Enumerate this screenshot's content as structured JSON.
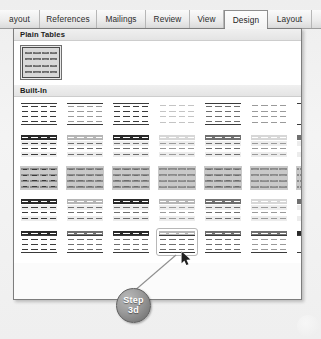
{
  "window": {
    "app_context": "word-table-styles-gallery"
  },
  "ribbon": {
    "tabs": [
      {
        "label": "ayout",
        "active": false,
        "clipped": true
      },
      {
        "label": "References",
        "active": false
      },
      {
        "label": "Mailings",
        "active": false
      },
      {
        "label": "Review",
        "active": false
      },
      {
        "label": "View",
        "active": false
      },
      {
        "label": "Design",
        "active": true
      },
      {
        "label": "Layout",
        "active": false
      }
    ]
  },
  "gallery": {
    "groups": [
      {
        "id": "plain-tables",
        "title": "Plain Tables",
        "tiles": [
          {
            "id": "plain-table-1",
            "style": "gridded",
            "selected": true
          }
        ]
      },
      {
        "id": "built-in",
        "title": "Built-In",
        "rows": [
          {
            "row": 1,
            "tiles": [
              {
                "id": "builtin-1-1",
                "header": "hdr-none",
                "body": "body-dark",
                "rules": true,
                "grid": false
              },
              {
                "id": "builtin-1-2",
                "header": "hdr-none",
                "body": "body-light",
                "rules": true,
                "grid": false
              },
              {
                "id": "builtin-1-3",
                "header": "hdr-none",
                "body": "body-dark",
                "rules": true,
                "grid": false
              },
              {
                "id": "builtin-1-4",
                "header": "hdr-none",
                "body": "body-faint",
                "rules": false,
                "grid": false
              },
              {
                "id": "builtin-1-5",
                "header": "hdr-none",
                "body": "body-mid",
                "rules": true,
                "grid": false
              },
              {
                "id": "builtin-1-6",
                "header": "hdr-none",
                "body": "body-light",
                "rules": false,
                "grid": false
              },
              {
                "id": "builtin-1-7",
                "header": "hdr-none",
                "body": "body-mid",
                "rules": true,
                "grid": false,
                "clipped": true
              }
            ]
          },
          {
            "row": 2,
            "tiles": [
              {
                "id": "builtin-2-1",
                "header": "hdr-dark",
                "body": "body-dark",
                "banded": true,
                "grid": false
              },
              {
                "id": "builtin-2-2",
                "header": "hdr-light",
                "body": "body-mid",
                "banded": true,
                "grid": false
              },
              {
                "id": "builtin-2-3",
                "header": "hdr-dark",
                "body": "body-mid",
                "banded": true,
                "grid": false
              },
              {
                "id": "builtin-2-4",
                "header": "hdr-faint",
                "body": "body-light",
                "banded": true,
                "grid": false
              },
              {
                "id": "builtin-2-5",
                "header": "hdr-mid",
                "body": "body-mid",
                "banded": true,
                "grid": false
              },
              {
                "id": "builtin-2-6",
                "header": "hdr-faint",
                "body": "body-light",
                "banded": true,
                "grid": false
              },
              {
                "id": "builtin-2-7",
                "header": "hdr-mid",
                "body": "body-mid",
                "banded": true,
                "grid": false,
                "clipped": true
              }
            ]
          },
          {
            "row": 3,
            "tiles": [
              {
                "id": "builtin-3-1",
                "header": "hdr-none",
                "body": "body-dark",
                "grid": true
              },
              {
                "id": "builtin-3-2",
                "header": "hdr-none",
                "body": "body-mid",
                "grid": true
              },
              {
                "id": "builtin-3-3",
                "header": "hdr-none",
                "body": "body-mid",
                "grid": true
              },
              {
                "id": "builtin-3-4",
                "header": "hdr-none",
                "body": "body-light",
                "grid": true
              },
              {
                "id": "builtin-3-5",
                "header": "hdr-none",
                "body": "body-mid",
                "grid": true
              },
              {
                "id": "builtin-3-6",
                "header": "hdr-none",
                "body": "body-light",
                "grid": true
              },
              {
                "id": "builtin-3-7",
                "header": "hdr-none",
                "body": "body-mid",
                "grid": true,
                "clipped": true
              }
            ]
          },
          {
            "row": 4,
            "tiles": [
              {
                "id": "builtin-4-1",
                "header": "hdr-dark",
                "body": "body-dark",
                "banded": true,
                "grid": false
              },
              {
                "id": "builtin-4-2",
                "header": "hdr-light",
                "body": "body-mid",
                "banded": true,
                "grid": false
              },
              {
                "id": "builtin-4-3",
                "header": "hdr-dark",
                "body": "body-mid",
                "banded": true,
                "grid": false
              },
              {
                "id": "builtin-4-4",
                "header": "hdr-light",
                "body": "body-light",
                "banded": true,
                "grid": false
              },
              {
                "id": "builtin-4-5",
                "header": "hdr-mid",
                "body": "body-mid",
                "banded": true,
                "grid": false
              },
              {
                "id": "builtin-4-6",
                "header": "hdr-faint",
                "body": "body-light",
                "banded": true,
                "grid": false
              },
              {
                "id": "builtin-4-7",
                "header": "hdr-mid",
                "body": "body-mid",
                "banded": true,
                "grid": false,
                "clipped": true
              }
            ]
          },
          {
            "row": 5,
            "tiles": [
              {
                "id": "builtin-5-1",
                "header": "hdr-dark",
                "body": "body-dark",
                "rules": true,
                "grid": false
              },
              {
                "id": "builtin-5-2",
                "header": "hdr-mid",
                "body": "body-mid",
                "rules": true,
                "grid": false
              },
              {
                "id": "builtin-5-3",
                "header": "hdr-dark",
                "body": "body-mid",
                "rules": true,
                "grid": false
              },
              {
                "id": "builtin-5-4",
                "header": "hdr-light",
                "body": "body-mid",
                "rules": true,
                "grid": false,
                "hovered": true
              },
              {
                "id": "builtin-5-5",
                "header": "hdr-mid",
                "body": "body-mid",
                "rules": true,
                "grid": false
              },
              {
                "id": "builtin-5-6",
                "header": "hdr-mid",
                "body": "body-light",
                "rules": true,
                "grid": false
              },
              {
                "id": "builtin-5-7",
                "header": "hdr-dark",
                "body": "body-mid",
                "rules": true,
                "grid": false,
                "clipped": true
              }
            ]
          }
        ]
      }
    ]
  },
  "annotation": {
    "step_badge": {
      "line1": "Step",
      "line2": "3d",
      "color": "#8a8a8a",
      "text_color": "#ffffff"
    },
    "leader_line": {
      "from_x": 133,
      "from_y": 292,
      "to_x": 176,
      "to_y": 255,
      "color": "#8f8f8f"
    }
  },
  "cursor": {
    "icon": "mouse-pointer-icon",
    "x": 181,
    "y": 251
  }
}
